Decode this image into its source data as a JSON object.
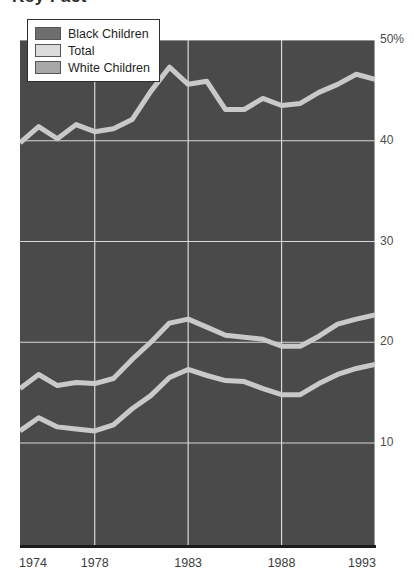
{
  "title_fragment": "Key Fact",
  "legend": {
    "position": "top-left",
    "items": [
      {
        "label": "Black Children",
        "swatch_color": "#6e6e6e",
        "icon": "legend-swatch-icon"
      },
      {
        "label": "Total",
        "swatch_color": "#dcdcdc",
        "icon": "legend-swatch-icon"
      },
      {
        "label": "White Children",
        "swatch_color": "#a8a8a8",
        "icon": "legend-swatch-icon"
      }
    ]
  },
  "colors": {
    "plot_background": "#4a4a4a",
    "gridline": "#d8d8d8",
    "series_line": "#c9c9c9",
    "axis": "#1c1c1c",
    "page_background": "#ffffff"
  },
  "chart_data": {
    "type": "line",
    "title": "",
    "xlabel": "",
    "ylabel": "",
    "grid": true,
    "legend_position": "top-left",
    "ylim": [
      0,
      50
    ],
    "ytick_labels": [
      "10",
      "20",
      "30",
      "40",
      "50%"
    ],
    "yticks": [
      10,
      20,
      30,
      40,
      50
    ],
    "xlim": [
      1974,
      1993
    ],
    "xtick_labels": [
      "1974",
      "1978",
      "1983",
      "1988",
      "1993"
    ],
    "xticks": [
      1974,
      1978,
      1983,
      1988,
      1993
    ],
    "x": [
      1974,
      1975,
      1976,
      1977,
      1978,
      1979,
      1980,
      1981,
      1982,
      1983,
      1984,
      1985,
      1986,
      1987,
      1988,
      1989,
      1990,
      1991,
      1992,
      1993
    ],
    "series": [
      {
        "name": "Black Children",
        "values": [
          39.8,
          41.4,
          40.2,
          41.6,
          40.9,
          41.2,
          42.1,
          44.9,
          47.3,
          45.6,
          45.9,
          43.1,
          43.1,
          44.2,
          43.5,
          43.7,
          44.8,
          45.6,
          46.6,
          46.1
        ]
      },
      {
        "name": "Total",
        "values": [
          15.4,
          16.8,
          15.7,
          16.0,
          15.9,
          16.4,
          18.3,
          20.0,
          21.9,
          22.3,
          21.5,
          20.7,
          20.5,
          20.3,
          19.6,
          19.6,
          20.6,
          21.8,
          22.3,
          22.7
        ]
      },
      {
        "name": "White Children",
        "values": [
          11.2,
          12.5,
          11.6,
          11.4,
          11.2,
          11.8,
          13.4,
          14.7,
          16.5,
          17.3,
          16.7,
          16.2,
          16.1,
          15.4,
          14.8,
          14.8,
          15.9,
          16.8,
          17.4,
          17.8
        ]
      }
    ]
  }
}
